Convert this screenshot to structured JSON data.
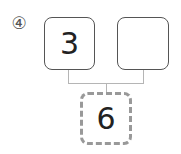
{
  "problem": {
    "number_label": "④"
  },
  "number_bond": {
    "left_part": "3",
    "right_part": "",
    "whole": "6"
  }
}
